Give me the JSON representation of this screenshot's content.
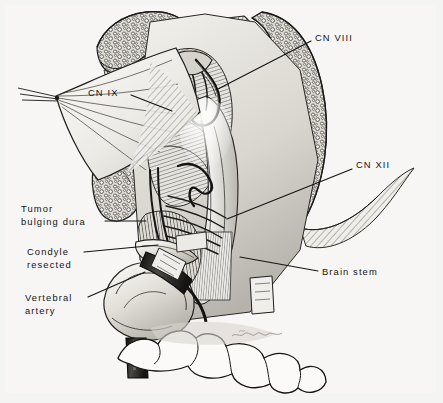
{
  "figure": {
    "kind": "medical-illustration",
    "technique": "pen-and-ink hatched surgical anatomy drawing",
    "background_color": "#f4f4f2",
    "ink_color": "#141414",
    "frame_color": "#e3e3e1",
    "signature": "artist signature (illegible script)"
  },
  "labels": [
    {
      "id": "cn-viii",
      "text": "CN VIII",
      "x": 315,
      "y": 32,
      "align": "left",
      "leader": {
        "x1": 311,
        "y1": 41,
        "x2": 216,
        "y2": 90
      }
    },
    {
      "id": "cn-ix",
      "text": "CN IX",
      "x": 88,
      "y": 87,
      "align": "left",
      "leader": {
        "x1": 131,
        "y1": 95,
        "x2": 172,
        "y2": 111
      }
    },
    {
      "id": "cn-xii",
      "text": "CN XII",
      "x": 356,
      "y": 159,
      "align": "left",
      "leader": {
        "x1": 352,
        "y1": 169,
        "x2": 227,
        "y2": 219
      }
    },
    {
      "id": "tumor-bulging-dura",
      "text": "Tumor\nbulging dura",
      "x": 21,
      "y": 203,
      "align": "left",
      "leader": {
        "x1": 105,
        "y1": 221,
        "x2": 146,
        "y2": 221
      }
    },
    {
      "id": "condyle-resected",
      "text": "Condyle\nresected",
      "x": 27,
      "y": 246,
      "align": "left",
      "leader": {
        "x1": 84,
        "y1": 252,
        "x2": 158,
        "y2": 245
      }
    },
    {
      "id": "vertebral-artery",
      "text": "Vertebral\nartery",
      "x": 25,
      "y": 292,
      "align": "left",
      "leader": {
        "x1": 88,
        "y1": 297,
        "x2": 145,
        "y2": 272
      }
    },
    {
      "id": "brain-stem",
      "text": "Brain stem",
      "x": 322,
      "y": 266,
      "align": "left",
      "leader": {
        "x1": 318,
        "y1": 271,
        "x2": 240,
        "y2": 257
      }
    }
  ],
  "structures": [
    {
      "id": "occipital-bone-upper-left",
      "name": "Cancellous occipital bone, upper left margin"
    },
    {
      "id": "bone-flap-right",
      "name": "Cancellous bone flap, right margin"
    },
    {
      "id": "dural-flap",
      "name": "Retracted dural flap with apex suture"
    },
    {
      "id": "cerebellum",
      "name": "Cerebellum / brain stem surface with hatching"
    },
    {
      "id": "cranial-nerve-bundles",
      "name": "Cranial nerve rootlets"
    },
    {
      "id": "vertebral-artery-tube",
      "name": "Vertebral artery (dark tubular vessel)"
    },
    {
      "id": "condyle",
      "name": "Resected occipital condyle"
    },
    {
      "id": "cottonoid-patties",
      "name": "Cottonoid patties / neuro pledgets"
    },
    {
      "id": "atlas-arch",
      "name": "Atlas arch / occipital outline at base"
    }
  ]
}
